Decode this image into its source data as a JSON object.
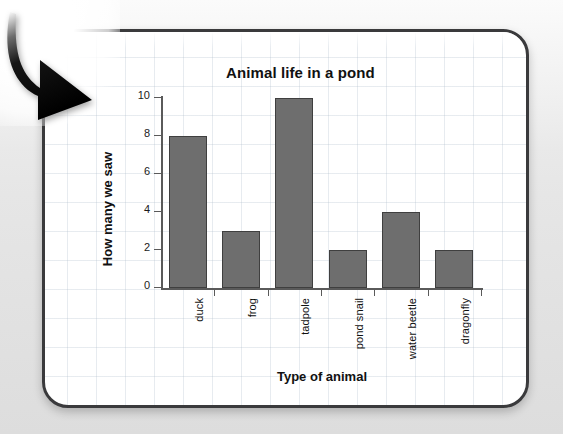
{
  "page": {
    "background_color": "#e9e9e9",
    "card_border_color": "#3a3a3c",
    "card_background_color": "#ffffff",
    "grid_line_color": "#b0becd"
  },
  "arrow": {
    "name": "down-right-curved-arrow",
    "color": "#0a0a0a"
  },
  "chart_data": {
    "type": "bar",
    "title": "Animal life in a pond",
    "xlabel": "Type of animal",
    "ylabel": "How many we saw",
    "categories": [
      "duck",
      "frog",
      "tadpole",
      "pond snail",
      "water beetle",
      "dragonfly"
    ],
    "values": [
      8,
      3,
      10,
      2,
      4,
      2
    ],
    "yticks": [
      "0",
      "2",
      "4",
      "6",
      "8",
      "10"
    ],
    "ytick_values": [
      0,
      2,
      4,
      6,
      8,
      10
    ],
    "ylim": [
      0,
      10
    ],
    "grid": true,
    "legend": false,
    "bar_color": "#6e6e6e",
    "bar_border_color": "#3f3f3f",
    "axis_color": "#5a5a5a"
  }
}
